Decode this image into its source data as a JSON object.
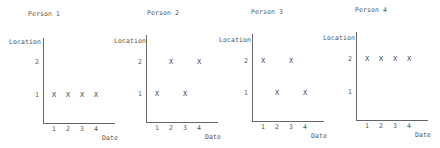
{
  "chart_data": [
    {
      "type": "scatter",
      "title": "Person 1",
      "xlabel": "Date",
      "ylabel": "Location",
      "x_ticks": [
        "1",
        "2",
        "3",
        "4"
      ],
      "y_ticks": [
        "1",
        "2"
      ],
      "marker": "X",
      "points": [
        {
          "x": 1,
          "y": 1
        },
        {
          "x": 2,
          "y": 1
        },
        {
          "x": 3,
          "y": 1
        },
        {
          "x": 4,
          "y": 1
        }
      ],
      "grid": false
    },
    {
      "type": "scatter",
      "title": "Person 2",
      "xlabel": "Date",
      "ylabel": "Location",
      "x_ticks": [
        "1",
        "2",
        "3",
        "4"
      ],
      "y_ticks": [
        "1",
        "2"
      ],
      "marker": "X",
      "points": [
        {
          "x": 1,
          "y": 1
        },
        {
          "x": 2,
          "y": 2
        },
        {
          "x": 3,
          "y": 1
        },
        {
          "x": 4,
          "y": 2
        }
      ],
      "grid": false
    },
    {
      "type": "scatter",
      "title": "Person 3",
      "xlabel": "Date",
      "ylabel": "Location",
      "x_ticks": [
        "1",
        "2",
        "3",
        "4"
      ],
      "y_ticks": [
        "1",
        "2"
      ],
      "marker": "X",
      "points": [
        {
          "x": 1,
          "y": 2
        },
        {
          "x": 2,
          "y": 1
        },
        {
          "x": 3,
          "y": 2
        },
        {
          "x": 4,
          "y": 1
        }
      ],
      "grid": false
    },
    {
      "type": "scatter",
      "title": "Person 4",
      "xlabel": "Date",
      "ylabel": "Location",
      "x_ticks": [
        "1",
        "2",
        "3",
        "4"
      ],
      "y_ticks": [
        "1",
        "2"
      ],
      "marker": "X",
      "points": [
        {
          "x": 1,
          "y": 2
        },
        {
          "x": 2,
          "y": 2
        },
        {
          "x": 3,
          "y": 2
        },
        {
          "x": 4,
          "y": 2
        }
      ],
      "grid": false
    }
  ],
  "layout": [
    {
      "ax": 43,
      "top": 38,
      "base": 123,
      "y1": 95,
      "y2": 62,
      "title_x": 28,
      "title_y": 14,
      "loc_x": 9,
      "loc_y": 42
    },
    {
      "ax": 146,
      "top": 35,
      "base": 122,
      "y1": 94,
      "y2": 62,
      "title_x": 147,
      "title_y": 13,
      "loc_x": 114,
      "loc_y": 41
    },
    {
      "ax": 252,
      "top": 34,
      "base": 121,
      "y1": 93,
      "y2": 61,
      "title_x": 251,
      "title_y": 12,
      "loc_x": 219,
      "loc_y": 40
    },
    {
      "ax": 356,
      "top": 32,
      "base": 120,
      "y1": 92,
      "y2": 59,
      "title_x": 355,
      "title_y": 10,
      "loc_x": 323,
      "loc_y": 38
    }
  ]
}
